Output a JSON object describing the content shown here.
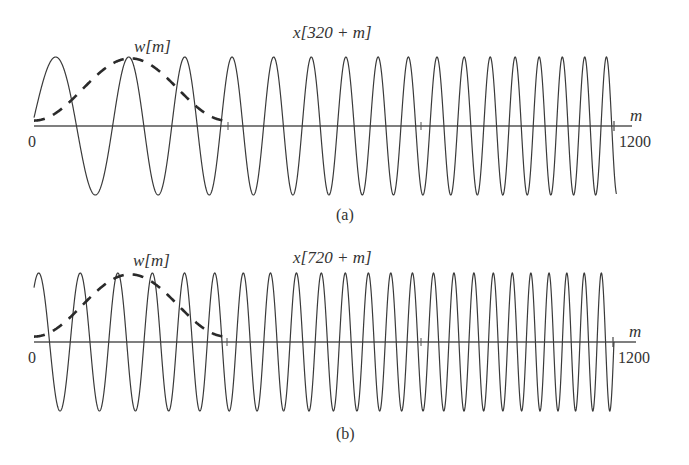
{
  "chart_data": [
    {
      "type": "line",
      "panel_label": "(a)",
      "title": "x[320 + m]",
      "window_label": "w[m]",
      "xlabel": "m",
      "x_tick_labels": [
        "0",
        "1200"
      ],
      "xlim": [
        0,
        1200
      ],
      "ylim": [
        -1,
        1
      ],
      "grid": false,
      "series": [
        {
          "name": "x[320 + m]",
          "style": "solid",
          "description": "linear chirp cos(alpha*(320+m)^2)",
          "offset": 320,
          "alpha": 4.72e-05
        },
        {
          "name": "w[m]",
          "style": "dashed",
          "description": "Hamming window, length 400",
          "length": 400
        }
      ],
      "peak_positions_m": [
        47,
        198,
        314,
        411,
        498,
        576,
        646,
        713,
        772,
        832,
        888,
        942,
        993,
        1043,
        1093,
        1138,
        1183
      ]
    },
    {
      "type": "line",
      "panel_label": "(b)",
      "title": "x[720 + m]",
      "window_label": "w[m]",
      "xlabel": "m",
      "x_tick_labels": [
        "0",
        "1200"
      ],
      "xlim": [
        0,
        1200
      ],
      "ylim": [
        -1,
        1
      ],
      "grid": false,
      "series": [
        {
          "name": "x[720 + m]",
          "style": "solid",
          "description": "linear chirp cos(alpha*(720+m)^2)",
          "offset": 720,
          "alpha": 4.72e-05
        },
        {
          "name": "w[m]",
          "style": "dashed",
          "description": "Hamming window, length 400",
          "length": 400
        }
      ]
    }
  ],
  "panels": {
    "a": {
      "title": "x[320 + m]",
      "window_label": "w[m]",
      "axis_label": "m",
      "tick_start": "0",
      "tick_end": "1200",
      "caption": "(a)"
    },
    "b": {
      "title": "x[720 + m]",
      "window_label": "w[m]",
      "axis_label": "m",
      "tick_start": "0",
      "tick_end": "1200",
      "caption": "(b)"
    }
  },
  "colors": {
    "line": "#3a3a3a",
    "text": "#333333",
    "background": "#ffffff"
  }
}
